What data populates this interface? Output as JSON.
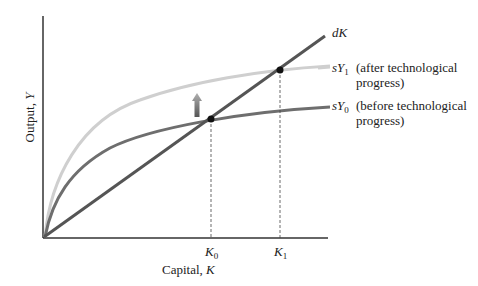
{
  "diagram": {
    "axes": {
      "x_label_text": "Capital, ",
      "x_label_var": "K",
      "y_label_text": "Output, ",
      "y_label_var": "Y"
    },
    "curves": [
      {
        "id": "dK",
        "label_var": "dK",
        "label_sub": "",
        "description": "",
        "color": "#555555",
        "type": "line"
      },
      {
        "id": "sY1",
        "label_var": "sY",
        "label_sub": "1",
        "description_line1": "(after technological",
        "description_line2": "progress)",
        "color": "#c8c8c8",
        "type": "concave"
      },
      {
        "id": "sY0",
        "label_var": "sY",
        "label_sub": "0",
        "description_line1": "(before technological",
        "description_line2": "progress)",
        "color": "#6e6e6e",
        "type": "concave"
      }
    ],
    "points": [
      {
        "id": "K0",
        "label_var": "K",
        "label_sub": "0",
        "x": 211,
        "y": 119
      },
      {
        "id": "K1",
        "label_var": "K",
        "label_sub": "1",
        "x": 280,
        "y": 70
      }
    ],
    "arrow": {
      "direction": "up",
      "meaning": "shift of saving curve due to technological progress"
    }
  }
}
